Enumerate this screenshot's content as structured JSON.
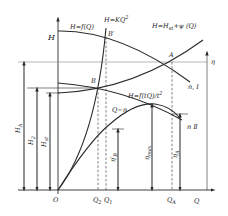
{
  "diagram": {
    "type": "pump-performance-curves",
    "axes": {
      "vertical_left": "H",
      "vertical_right": "η",
      "horizontal": "Q",
      "origin": "O"
    },
    "curves": {
      "pump_head": "H=f(Q)",
      "parabola": "H=KQ",
      "parabola_sup": "2",
      "system": "H=H",
      "system_sub": "st",
      "system_tail": "+ψ (Q)",
      "reduced_head": "H=f(tQ)/t",
      "reduced_sup": "2",
      "efficiency": "Q−η",
      "speed_1": "n, Ⅰ",
      "speed_2": "n Ⅱ"
    },
    "points": {
      "A": "A",
      "B": "B",
      "B_prime": "B′"
    },
    "dimensions": {
      "H_A": "H",
      "H_A_sub": "A",
      "H_2": "H",
      "H_2_sub": "2",
      "H_st": "H",
      "H_st_sub": "st",
      "eta_B": "η′",
      "eta_B_sub": "B",
      "eta_max": "η",
      "eta_max_sub": "max",
      "eta_A": "η",
      "eta_A_sub": "A"
    },
    "q_ticks": {
      "Q2": "Q",
      "Q2_sub": "2",
      "Q1": "Q",
      "Q1_sub": "1",
      "QA": "Q",
      "QA_sub": "A"
    },
    "colors": {
      "line": "#2a2a2a",
      "background": "#ffffff"
    }
  }
}
